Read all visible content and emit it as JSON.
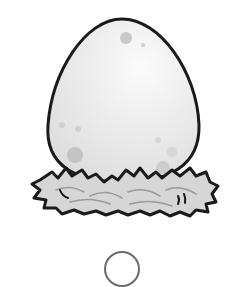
{
  "image": {
    "subject": "egg-in-nest",
    "alt": "Cartoon egg sitting in a nest"
  },
  "colors": {
    "outline": "#1a1a1a",
    "egg_fill": "#e9e9e9",
    "egg_highlight": "#f8f8f8",
    "spot": "#c4c4c4",
    "nest_fill": "#d4d4d4",
    "nest_stroke": "#8a8a8a",
    "selector_ring": "#6b6b6b"
  },
  "selector": {
    "state": "unselected"
  }
}
